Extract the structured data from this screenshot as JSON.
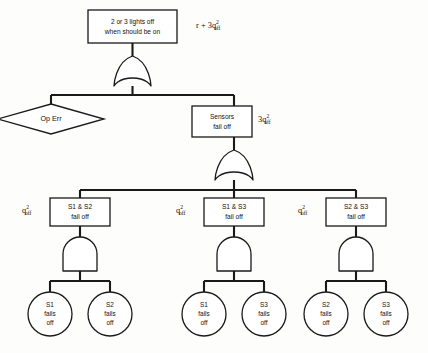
{
  "diagram": {
    "type": "fault-tree",
    "title_node": {
      "label_line1": "2 or 3 lights off",
      "label_line2": "when should be on",
      "probability": "r + 3q",
      "probability_sup": "2",
      "probability_sub": "off"
    },
    "gates": [
      {
        "id": "top-or-gate",
        "kind": "OR",
        "name": "top-or-gate"
      },
      {
        "id": "sensors-or-gate",
        "kind": "OR",
        "name": "sensors-or-gate"
      },
      {
        "id": "and-gate-s1s2",
        "kind": "AND",
        "name": "and-gate-s1-s2"
      },
      {
        "id": "and-gate-s1s3",
        "kind": "AND",
        "name": "and-gate-s1-s3"
      },
      {
        "id": "and-gate-s2s3",
        "kind": "AND",
        "name": "and-gate-s2-s3"
      }
    ],
    "op_err": {
      "label": "Op Err"
    },
    "sensors_node": {
      "label_line1": "Sensors",
      "label_line2": "fail off",
      "probability": "3q",
      "probability_sup": "2",
      "probability_sub": "off"
    },
    "pair_nodes": [
      {
        "label_line1": "S1 & S2",
        "label_line2": "fail off",
        "probability": "q",
        "probability_sup": "2",
        "probability_sub": "off"
      },
      {
        "label_line1": "S1 & S3",
        "label_line2": "fail off",
        "probability": "q",
        "probability_sup": "2",
        "probability_sub": "off"
      },
      {
        "label_line1": "S2 & S3",
        "label_line2": "fail off",
        "probability": "q",
        "probability_sup": "2",
        "probability_sub": "off"
      }
    ],
    "basic_events": [
      {
        "line1": "S1",
        "line2": "fails",
        "line3": "off"
      },
      {
        "line1": "S2",
        "line2": "fails",
        "line3": "off"
      },
      {
        "line1": "S1",
        "line2": "fails",
        "line3": "off"
      },
      {
        "line1": "S3",
        "line2": "fails",
        "line3": "off"
      },
      {
        "line1": "S2",
        "line2": "fails",
        "line3": "off"
      },
      {
        "line1": "S3",
        "line2": "fails",
        "line3": "off"
      }
    ],
    "colors": {
      "stroke": "#1a1a1a",
      "fill": "#ffffff",
      "background": "#fdfdfb"
    }
  }
}
